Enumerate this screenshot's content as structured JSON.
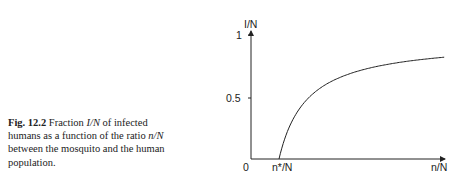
{
  "caption": {
    "label": "Fig. 12.2",
    "text_parts": [
      "Fraction ",
      "I/N",
      " of infected humans as a function of the ratio ",
      "n/N",
      " between the mosquito and the human population."
    ]
  },
  "chart_data": {
    "type": "line",
    "title": "",
    "xlabel": "n/N",
    "ylabel": "I/N",
    "x_ticks": [
      "0",
      "n*/N"
    ],
    "y_ticks": [
      "0.5",
      "1"
    ],
    "ylim": [
      0,
      1
    ],
    "grid": false,
    "legend": null,
    "series": [
      {
        "name": "I/N",
        "formula": "I/N = 1 - (n*/N)/(n/N) for n > n*",
        "x_in_units_of_nstar": [
          1,
          1.5,
          2,
          3,
          4,
          5,
          6,
          6.9
        ],
        "values": [
          0,
          0.33,
          0.5,
          0.67,
          0.75,
          0.8,
          0.83,
          0.85
        ]
      }
    ]
  },
  "labels": {
    "origin": "0",
    "threshold": "n*/N",
    "x_axis": "n/N",
    "y_axis": "I/N",
    "y_one": "1",
    "y_half": "0.5"
  }
}
